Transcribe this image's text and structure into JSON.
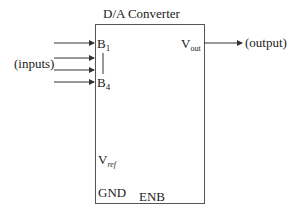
{
  "diagram": {
    "title": "D/A Converter",
    "inputs_label": "(inputs)",
    "output_label": "(output)",
    "pins": {
      "b1": {
        "main": "B",
        "sub": "1"
      },
      "b4": {
        "main": "B",
        "sub": "4"
      },
      "vout": {
        "main": "V",
        "sub": "out"
      },
      "vref": {
        "main": "V",
        "sub": "ref"
      },
      "gnd": "GND",
      "enb": "ENB"
    },
    "input_arrow_count": 4,
    "colors": {
      "line": "#333333",
      "text": "#222222"
    }
  }
}
